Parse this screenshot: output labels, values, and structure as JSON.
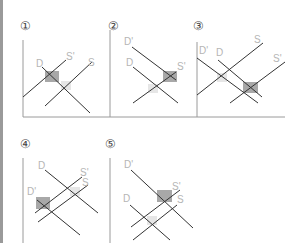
{
  "panels": [
    {
      "number": "①",
      "labels": {
        "d": "D",
        "s_prime": "S'",
        "s": "S"
      }
    },
    {
      "number": "②",
      "labels": {
        "d_prime": "D'",
        "d": "D",
        "s": "S'"
      }
    },
    {
      "number": "③",
      "labels": {
        "d_prime": "D'",
        "d": "D",
        "s": "S",
        "s_prime": "S'"
      }
    },
    {
      "number": "④",
      "labels": {
        "d": "D",
        "s_prime": "S'",
        "s": "S",
        "d_prime": "D'"
      }
    },
    {
      "number": "⑤",
      "labels": {
        "d_prime": "D'",
        "s_prime": "S'",
        "s": "S",
        "d": "D"
      }
    }
  ],
  "colors": {
    "axis": "#9a9a9a",
    "line": "#333333",
    "shade_dark": "#a8a8a8",
    "shade_light": "#e6e6e6",
    "label": "#b5b5b5"
  }
}
